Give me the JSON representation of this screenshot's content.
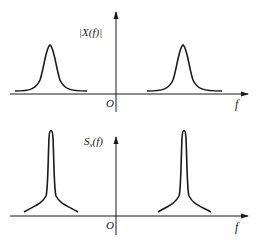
{
  "figure": {
    "top_panel": {
      "y_label": "|X(f)|",
      "x_label": "f",
      "origin_label": "O",
      "curve": "wide-peaked spectrum, two symmetric lobes at ±f0"
    },
    "bottom_panel": {
      "y_label_main": "S",
      "y_label_sub": "x",
      "y_label_tail": "(f)",
      "x_label": "f",
      "origin_label": "O",
      "curve": "narrow sharply-peaked spectrum, two symmetric lobes at ±f0"
    },
    "colors": {
      "stroke": "#1a1a1a",
      "background": "#ffffff"
    }
  }
}
